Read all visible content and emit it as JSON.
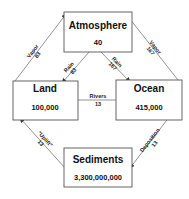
{
  "reservoirs": {
    "atmosphere": {
      "name": "Atmosphere",
      "amount": "40"
    },
    "land": {
      "name": "Land",
      "amount": "100,000"
    },
    "ocean": {
      "name": "Ocean",
      "amount": "415,000"
    },
    "sediments": {
      "name": "Sediments",
      "amount": "3,300,000,000"
    }
  },
  "flows": {
    "land_vapor": {
      "name": "Vapor",
      "value": "83"
    },
    "land_rain": {
      "name": "Rain",
      "value": "83"
    },
    "ocean_rain": {
      "name": "Rain",
      "value": "167"
    },
    "ocean_vapor": {
      "name": "Vapor",
      "value": "167"
    },
    "rivers": {
      "name": "Rivers",
      "value": "13"
    },
    "uplift": {
      "name": "\"Uplift\"",
      "value": "13"
    },
    "deposition": {
      "name": "Deposition",
      "value": "13"
    }
  },
  "colors": {
    "box_stroke": "#555555",
    "arrow": "#666666",
    "text": "#111111"
  }
}
